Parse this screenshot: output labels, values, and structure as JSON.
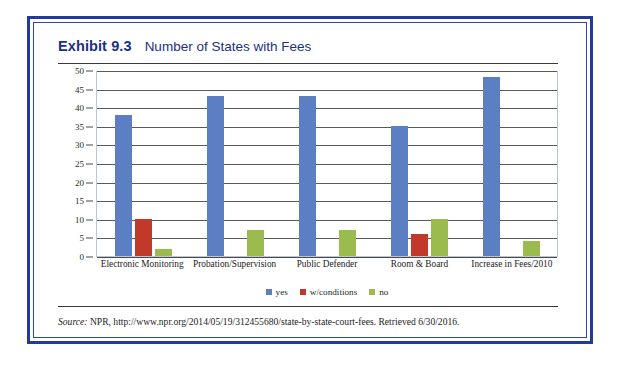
{
  "exhibit": {
    "label": "Exhibit 9.3",
    "title": "Number of States with Fees",
    "frame_color": "#23399b"
  },
  "source": {
    "prefix": "Source:",
    "text": " NPR, http://www.npr.org/2014/05/19/312455680/state-by-state-court-fees. Retrieved 6/30/2016."
  },
  "chart_data": {
    "type": "bar",
    "title": "Number of States with Fees",
    "xlabel": "",
    "ylabel": "",
    "ylim": [
      0,
      50
    ],
    "yticks": [
      0,
      5,
      10,
      15,
      20,
      25,
      30,
      35,
      40,
      45,
      50
    ],
    "grid": true,
    "legend_position": "bottom",
    "categories": [
      "Electronic Monitoring",
      "Probation/Supervision",
      "Public Defender",
      "Room & Board",
      "Increase in Fees/2010"
    ],
    "series": [
      {
        "name": "yes",
        "color": "#5b7fc2",
        "values": [
          38,
          43,
          43,
          35,
          48
        ]
      },
      {
        "name": "w/conditions",
        "color": "#c0392b",
        "values": [
          10,
          0,
          0,
          6,
          0
        ]
      },
      {
        "name": "no",
        "color": "#9bbb4f",
        "values": [
          2,
          7,
          7,
          10,
          4
        ]
      }
    ]
  }
}
